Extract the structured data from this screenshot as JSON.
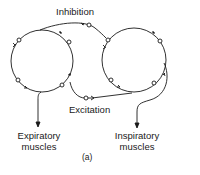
{
  "diagram": {
    "labels": {
      "inhibition": "Inhibition",
      "excitation": "Excitation",
      "expiratory_line1": "Expiratory",
      "expiratory_line2": "muscles",
      "inspiratory_line1": "Inspiratory",
      "inspiratory_line2": "muscles",
      "caption": "(a)"
    },
    "nodes": [
      {
        "id": "left-ring",
        "type": "neuron-ring",
        "cx": 42,
        "cy": 61,
        "r": 31
      },
      {
        "id": "right-ring",
        "type": "neuron-ring",
        "cx": 134,
        "cy": 60,
        "r": 32
      }
    ],
    "connections": [
      {
        "from": "left-ring",
        "to": "right-ring",
        "label": "Inhibition"
      },
      {
        "from": "left-ring",
        "to": "right-ring",
        "label": "Excitation"
      },
      {
        "from": "left-ring",
        "to": "Expiratory muscles"
      },
      {
        "from": "right-ring",
        "to": "Inspiratory muscles"
      }
    ],
    "colors": {
      "stroke": "#1a1a1a",
      "background": "#ffffff"
    }
  }
}
